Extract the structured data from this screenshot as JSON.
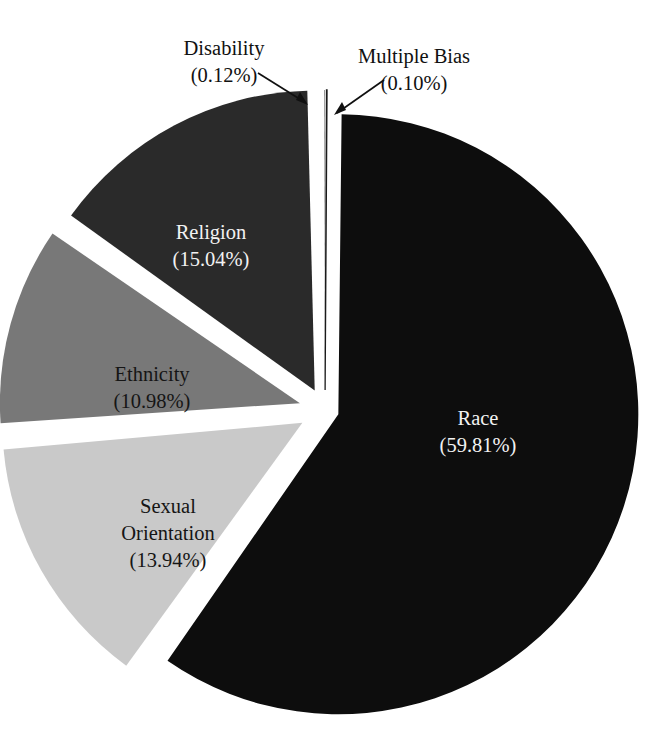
{
  "figure": {
    "background_color": "#ffffff",
    "width": 661,
    "height": 747
  },
  "chart_data": {
    "type": "pie",
    "title": "",
    "subtitle": "",
    "xlabel": "",
    "ylabel": "",
    "grid": false,
    "legend_position": "none",
    "label_format": "name (value%)",
    "exploded": true,
    "start_angle_deg": -90,
    "direction": "clockwise",
    "center": {
      "x": 325,
      "y": 410
    },
    "radius": 300,
    "categories": [
      "Race",
      "Sexual Orientation",
      "Ethnicity",
      "Religion",
      "Disability",
      "Multiple Bias"
    ],
    "values": [
      59.81,
      13.94,
      10.98,
      15.04,
      0.12,
      0.1
    ],
    "units": "percent",
    "slices": [
      {
        "name": "Race",
        "value": 59.81,
        "value_text": "(59.81%)",
        "label_lines": [
          "Race",
          "(59.81%)"
        ],
        "fill": "#0d0d0d",
        "text_color": "#f2f2f2",
        "label_style": "inside",
        "label_pos": {
          "x": 478,
          "y": 430
        }
      },
      {
        "name": "Sexual Orientation",
        "value": 13.94,
        "value_text": "(13.94%)",
        "label_lines": [
          "Sexual",
          "Orientation",
          "(13.94%)"
        ],
        "fill": "#c9c9c9",
        "text_color": "#151515",
        "label_style": "inside",
        "label_pos": {
          "x": 168,
          "y": 505
        }
      },
      {
        "name": "Ethnicity",
        "value": 10.98,
        "value_text": "(10.98%)",
        "label_lines": [
          "Ethnicity",
          "(10.98%)"
        ],
        "fill": "#787878",
        "text_color": "#151515",
        "label_style": "inside",
        "label_pos": {
          "x": 152,
          "y": 384
        }
      },
      {
        "name": "Religion",
        "value": 15.04,
        "value_text": "(15.04%)",
        "label_lines": [
          "Religion",
          "(15.04%)"
        ],
        "fill": "#2a2a2a",
        "text_color": "#f2f2f2",
        "label_style": "inside",
        "label_pos": {
          "x": 211,
          "y": 243
        }
      },
      {
        "name": "Disability",
        "value": 0.12,
        "value_text": "(0.12%)",
        "label_lines": [
          "Disability",
          "(0.12%)"
        ],
        "fill": "#4a4a4a",
        "text_color": "#111111",
        "label_style": "callout",
        "label_pos": {
          "x": 224,
          "y": 55
        }
      },
      {
        "name": "Multiple Bias",
        "value": 0.1,
        "value_text": "(0.10%)",
        "label_lines": [
          "Multiple Bias",
          "(0.10%)"
        ],
        "fill": "#ffffff",
        "text_color": "#111111",
        "label_style": "callout",
        "label_pos": {
          "x": 414,
          "y": 63
        }
      }
    ]
  },
  "labels": {
    "race": {
      "line1": "Race",
      "line2": "(59.81%)"
    },
    "sexual_orientation": {
      "line1": "Sexual",
      "line2": "Orientation",
      "line3": "(13.94%)"
    },
    "ethnicity": {
      "line1": "Ethnicity",
      "line2": "(10.98%)"
    },
    "religion": {
      "line1": "Religion",
      "line2": "(15.04%)"
    },
    "disability": {
      "line1": "Disability",
      "line2": "(0.12%)"
    },
    "multiple_bias": {
      "line1": "Multiple Bias",
      "line2": "(0.10%)"
    }
  }
}
